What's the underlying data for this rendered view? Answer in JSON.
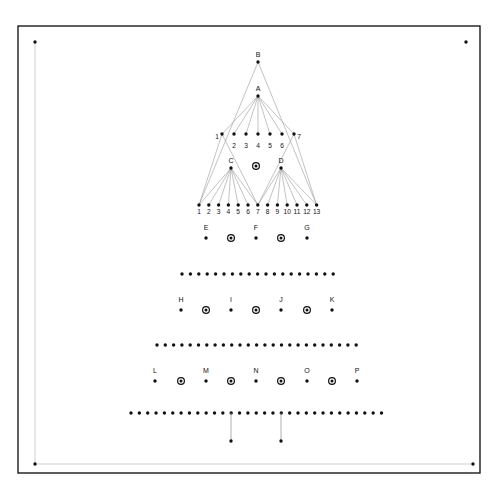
{
  "canvas": {
    "width": 498,
    "height": 491,
    "background": "#ffffff"
  },
  "frame": {
    "name": "outer-border",
    "x": 18,
    "y": 26,
    "w": 462,
    "h": 447,
    "color": "#1a1a1a",
    "stroke": 1.4
  },
  "axes": {
    "color": "#cfcfcf",
    "stroke": 1,
    "origin_dot": {
      "x": 35,
      "y": 464
    },
    "vertical": {
      "x": 35,
      "y1": 42,
      "y2": 464
    },
    "horizontal": {
      "y": 464,
      "x1": 35,
      "x2": 473
    },
    "end_dot_top": {
      "x": 35,
      "y": 42
    },
    "end_dot_right": {
      "x": 473,
      "y": 464
    },
    "corner_dot_top_right": {
      "x": 466,
      "y": 42
    }
  },
  "dot_style": {
    "plain_color": "#111111",
    "plain_radius": 1.7,
    "circled_outer_radius": 3.4,
    "circled_ring_color": "#111111",
    "circled_ring_width": 1.2,
    "circled_inner_radius": 1.5
  },
  "edge_style": {
    "color": "#9a9aa0",
    "stroke": 0.6
  },
  "tree": {
    "name": "hierarchy-tree",
    "root": {
      "label": "B",
      "x": 258,
      "y": 62
    },
    "level_a": {
      "label": "A",
      "x": 258,
      "y": 96
    },
    "level_mid": {
      "y": 134,
      "x_start": 222,
      "x_step": 12,
      "labels": [
        "1",
        "2",
        "3",
        "4",
        "5",
        "6",
        "7"
      ],
      "label_positions_y": [
        133,
        142,
        142,
        142,
        142,
        142,
        133
      ]
    },
    "level_cd": {
      "y": 168,
      "nodes": [
        {
          "label": "C",
          "x": 231
        },
        {
          "label": "D",
          "x": 281
        }
      ],
      "center_circled": {
        "x": 256,
        "y": 166
      }
    },
    "level_leaf": {
      "y": 205,
      "x_start": 199,
      "x_step": 9.8,
      "labels": [
        "1",
        "2",
        "3",
        "4",
        "5",
        "6",
        "7",
        "8",
        "9",
        "10",
        "11",
        "12",
        "13"
      ]
    }
  },
  "rows": [
    {
      "name": "row-efg",
      "label_y": 230,
      "dot_y": 238,
      "items": [
        {
          "kind": "labeled",
          "label": "E",
          "x": 206
        },
        {
          "kind": "circled",
          "label": "",
          "x": 231
        },
        {
          "kind": "labeled",
          "label": "F",
          "x": 256
        },
        {
          "kind": "circled",
          "label": "",
          "x": 281
        },
        {
          "kind": "labeled",
          "label": "G",
          "x": 307
        }
      ]
    },
    {
      "name": "row-hijk",
      "label_y": 302,
      "dot_y": 310,
      "items": [
        {
          "kind": "labeled",
          "label": "H",
          "x": 181
        },
        {
          "kind": "circled",
          "label": "",
          "x": 206
        },
        {
          "kind": "labeled",
          "label": "I",
          "x": 231
        },
        {
          "kind": "circled",
          "label": "",
          "x": 256
        },
        {
          "kind": "labeled",
          "label": "J",
          "x": 281
        },
        {
          "kind": "circled",
          "label": "",
          "x": 307
        },
        {
          "kind": "labeled",
          "label": "K",
          "x": 332
        }
      ]
    },
    {
      "name": "row-lmnop",
      "label_y": 373,
      "dot_y": 381,
      "items": [
        {
          "kind": "labeled",
          "label": "L",
          "x": 155
        },
        {
          "kind": "circled",
          "label": "",
          "x": 181
        },
        {
          "kind": "labeled",
          "label": "M",
          "x": 206
        },
        {
          "kind": "circled",
          "label": "",
          "x": 231
        },
        {
          "kind": "labeled",
          "label": "N",
          "x": 256
        },
        {
          "kind": "circled",
          "label": "",
          "x": 281
        },
        {
          "kind": "labeled",
          "label": "O",
          "x": 307
        },
        {
          "kind": "circled",
          "label": "",
          "x": 332
        },
        {
          "kind": "labeled",
          "label": "P",
          "x": 357
        }
      ]
    }
  ],
  "dot_rows": [
    {
      "name": "dot-row-1",
      "y": 274,
      "x_start": 182,
      "count": 19,
      "step": 8.4
    },
    {
      "name": "dot-row-2",
      "y": 345,
      "x_start": 157,
      "count": 25,
      "step": 8.3
    },
    {
      "name": "dot-row-3",
      "y": 413,
      "x_start": 131,
      "count": 31,
      "step": 8.35
    }
  ],
  "drops": {
    "name": "drop-lines",
    "color": "#9a9aa0",
    "stroke": 0.8,
    "from_y": 413,
    "to_y": 441,
    "items": [
      {
        "x": 231
      },
      {
        "x": 281
      }
    ]
  }
}
